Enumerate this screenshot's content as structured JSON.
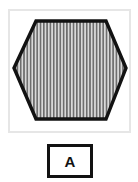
{
  "figure": {
    "name": "hexagon-fill-pattern-figure",
    "background_color": "#ffffff",
    "panel": {
      "border_color": "#e6e6e6",
      "fill_color": "#ffffff"
    },
    "shape": {
      "type": "hexagon",
      "orientation": "flat-top-pointy-sides",
      "outline_color": "#121212",
      "outline_width_px": 3,
      "fill": {
        "pattern": "vertical-stripes",
        "stripe_color": "#6b6b6b",
        "gap_color": "#d9d9d9",
        "stripe_width_px": 1.6,
        "stripe_period_px": 3.3,
        "stripe_count": 34
      },
      "vertices": [
        [
          13,
          66
        ],
        [
          34,
          19
        ],
        [
          104,
          19
        ],
        [
          125,
          66
        ],
        [
          104,
          117
        ],
        [
          34,
          117
        ]
      ]
    }
  },
  "label": {
    "letter": "A",
    "box_border_color": "#121212",
    "box_fill_color": "#ffffff",
    "text_color": "#121212"
  }
}
